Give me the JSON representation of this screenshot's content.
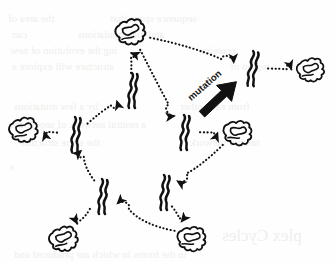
{
  "figure": {
    "background_color": "#fefefe",
    "ink_color": "#111111",
    "width": 336,
    "height": 262
  },
  "labels": {
    "mutation": {
      "text": "mutation",
      "x": 189,
      "y": 93,
      "rotation_deg": -41,
      "style": "bold-italic-slanted"
    }
  },
  "legend_of_glyphs": {
    "folded_protein": "compact folded globular protein outline",
    "unfolded_chain": "extended unfolded polypeptide squiggle",
    "dotted_arrow": "dotted transition arrow between states",
    "solid_arrow": "bold solid arrow indicating a mutation event"
  },
  "nodes": [
    {
      "id": "n1",
      "type": "folded",
      "label": "folded protein",
      "x": 131,
      "y": 32,
      "scale": 1.0,
      "rot": -8
    },
    {
      "id": "n2",
      "type": "unfolded",
      "label": "unfolded chain",
      "x": 131,
      "y": 90,
      "scale": 1.0,
      "rot": 0
    },
    {
      "id": "n3",
      "type": "unfolded",
      "label": "unfolded chain",
      "x": 251,
      "y": 68,
      "scale": 1.0,
      "rot": 4
    },
    {
      "id": "n4",
      "type": "folded",
      "label": "folded protein",
      "x": 311,
      "y": 70,
      "scale": 0.92,
      "rot": -4
    },
    {
      "id": "n5",
      "type": "unfolded",
      "label": "unfolded chain",
      "x": 183,
      "y": 132,
      "scale": 1.0,
      "rot": 0
    },
    {
      "id": "n6",
      "type": "folded",
      "label": "folded protein",
      "x": 238,
      "y": 133,
      "scale": 0.96,
      "rot": 6
    },
    {
      "id": "n7",
      "type": "folded",
      "label": "folded protein",
      "x": 24,
      "y": 130,
      "scale": 0.96,
      "rot": -6
    },
    {
      "id": "n8",
      "type": "unfolded",
      "label": "unfolded chain",
      "x": 74,
      "y": 134,
      "scale": 1.0,
      "rot": 0
    },
    {
      "id": "n9",
      "type": "unfolded",
      "label": "unfolded chain",
      "x": 101,
      "y": 196,
      "scale": 1.0,
      "rot": 0
    },
    {
      "id": "n10",
      "type": "unfolded",
      "label": "unfolded chain",
      "x": 163,
      "y": 192,
      "scale": 1.0,
      "rot": 0
    },
    {
      "id": "n11",
      "type": "folded",
      "label": "folded protein",
      "x": 64,
      "y": 239,
      "scale": 0.96,
      "rot": -10
    },
    {
      "id": "n12",
      "type": "folded",
      "label": "folded protein",
      "x": 192,
      "y": 239,
      "scale": 0.96,
      "rot": 4
    }
  ],
  "edges": [
    {
      "id": "e1",
      "kind": "dotted",
      "from": "n2",
      "to": "n1",
      "label": "folding transition"
    },
    {
      "id": "e2",
      "kind": "dotted",
      "from": "n1",
      "to": "n3",
      "label": "transition"
    },
    {
      "id": "e3",
      "kind": "dotted",
      "from": "n1",
      "to": "n5",
      "label": "transition"
    },
    {
      "id": "e4",
      "kind": "dotted",
      "from": "n3",
      "to": "n4",
      "label": "folding transition"
    },
    {
      "id": "e5",
      "kind": "dotted",
      "from": "n5",
      "to": "n6",
      "label": "folding transition"
    },
    {
      "id": "e6",
      "kind": "dotted",
      "from": "n8",
      "to": "n7",
      "label": "folding transition"
    },
    {
      "id": "e7",
      "kind": "dotted",
      "from": "n8",
      "to": "n2",
      "label": "transition"
    },
    {
      "id": "e8",
      "kind": "dotted",
      "from": "n9",
      "to": "n8",
      "label": "transition"
    },
    {
      "id": "e9",
      "kind": "dotted",
      "from": "n9",
      "to": "n11",
      "label": "folding transition"
    },
    {
      "id": "e10",
      "kind": "dotted",
      "from": "n6",
      "to": "n10",
      "label": "transition"
    },
    {
      "id": "e11",
      "kind": "dotted",
      "from": "n10",
      "to": "n12",
      "label": "folding transition"
    },
    {
      "id": "e12",
      "kind": "dotted",
      "from": "n12",
      "to": "n9",
      "label": "transition"
    },
    {
      "id": "e13",
      "kind": "solid",
      "from": "n5",
      "to": "n3",
      "label": "mutation"
    }
  ],
  "ghost_text": {
    "note": "faint show-through text from reverse side of the printed page",
    "lines": [
      {
        "text": "the area of",
        "x": 8,
        "y": 12,
        "size": 11
      },
      {
        "text": "sequence space that",
        "x": 110,
        "y": 12,
        "size": 11
      },
      {
        "text": "can",
        "x": 12,
        "y": 28,
        "size": 11
      },
      {
        "text": "and the  populations",
        "x": 78,
        "y": 28,
        "size": 11
      },
      {
        "text": "ing the  evolution of new",
        "x": 10,
        "y": 44,
        "size": 11
      },
      {
        "text": "proteins",
        "x": 200,
        "y": 44,
        "size": 11
      },
      {
        "text": "structure will  explore a",
        "x": 12,
        "y": 60,
        "size": 11
      },
      {
        "text": "region of",
        "x": 230,
        "y": 60,
        "size": 11
      },
      {
        "text": "by a few mutations",
        "x": 14,
        "y": 100,
        "size": 11
      },
      {
        "text": "from each other",
        "x": 180,
        "y": 100,
        "size": 11
      },
      {
        "text": "a  neutral  network  of  sequences",
        "x": 10,
        "y": 118,
        "size": 11
      },
      {
        "text": "the  same  structure",
        "x": 20,
        "y": 136,
        "size": 11
      },
      {
        "text": "neutral  network",
        "x": 190,
        "y": 136,
        "size": 11
      },
      {
        "text": "s",
        "x": 10,
        "y": 160,
        "size": 11
      },
      {
        "text": "plex Cycles",
        "x": 222,
        "y": 226,
        "size": 17
      },
      {
        "text": "in the forms in  which  are  produced  and",
        "x": 14,
        "y": 248,
        "size": 11
      }
    ]
  }
}
